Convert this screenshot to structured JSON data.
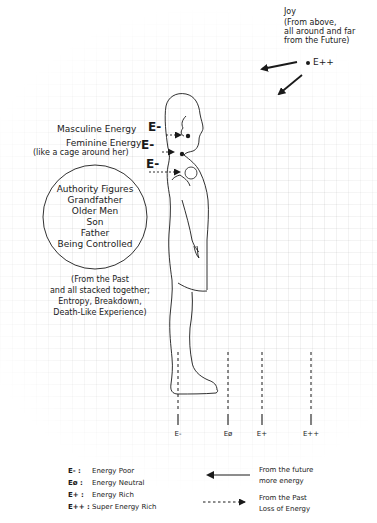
{
  "joy": {
    "title": "Joy",
    "line1": "(From above,",
    "line2": "all around and far",
    "line3": "from the Future)",
    "level": "E++"
  },
  "annotations": {
    "masculine": {
      "label": "Masculine Energy",
      "level": "E-"
    },
    "feminine": {
      "line1": "Feminine Energy",
      "line2": "(like a cage around her)",
      "level": "E-"
    },
    "chest": {
      "level": "E-"
    }
  },
  "circle": {
    "items": [
      "Authority Figures",
      "Grandfather",
      "Older Men",
      "Son",
      "Father",
      "Being Controlled"
    ]
  },
  "past_note": {
    "lines": [
      "(From the Past",
      "and  all stacked together;",
      "Entropy, Breakdown,",
      "Death-Like Experience)"
    ]
  },
  "scale": {
    "markers": [
      {
        "label": "E-",
        "x": 178
      },
      {
        "label": "Eø",
        "x": 228
      },
      {
        "label": "E+",
        "x": 262
      },
      {
        "label": "E++",
        "x": 311
      }
    ]
  },
  "legend": {
    "levels": [
      {
        "code": "E- :",
        "desc": "Energy Poor"
      },
      {
        "code": "Eø :",
        "desc": "Energy Neutral"
      },
      {
        "code": "E+ :",
        "desc": "Energy Rich"
      },
      {
        "code": "E++ :",
        "desc": "Super Energy Rich"
      }
    ],
    "arrows": [
      {
        "type": "solid",
        "line1": "From the future",
        "line2": "more energy"
      },
      {
        "type": "dashed",
        "line1": "From the Past",
        "line2": "Loss of Energy"
      }
    ]
  },
  "colors": {
    "ink": "#1a1a1a",
    "grid": "#e8e8e8",
    "background": "#ffffff"
  }
}
